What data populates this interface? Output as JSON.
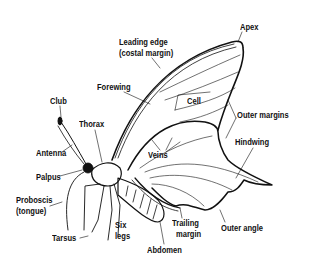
{
  "diagram": {
    "colors": {
      "ink": "#111111",
      "background": "#ffffff"
    },
    "labels": [
      {
        "id": "apex",
        "text": "Apex",
        "x": 240,
        "y": 23
      },
      {
        "id": "leading-edge",
        "text": "Leading edge",
        "x": 119,
        "y": 38
      },
      {
        "id": "costal-margin",
        "text": "(costal margin)",
        "x": 119,
        "y": 49
      },
      {
        "id": "forewing",
        "text": "Forewing",
        "x": 97,
        "y": 83
      },
      {
        "id": "club",
        "text": "Club",
        "x": 50,
        "y": 97
      },
      {
        "id": "cell",
        "text": "Cell",
        "x": 187,
        "y": 97
      },
      {
        "id": "outer-margins",
        "text": "Outer margins",
        "x": 237,
        "y": 111
      },
      {
        "id": "thorax",
        "text": "Thorax",
        "x": 79,
        "y": 120
      },
      {
        "id": "hindwing",
        "text": "Hindwing",
        "x": 235,
        "y": 138
      },
      {
        "id": "veins",
        "text": "Veins",
        "x": 148,
        "y": 151
      },
      {
        "id": "antenna",
        "text": "Antenna",
        "x": 36,
        "y": 149
      },
      {
        "id": "palpus",
        "text": "Palpus",
        "x": 36,
        "y": 173
      },
      {
        "id": "proboscis",
        "text": "Proboscis",
        "x": 16,
        "y": 196
      },
      {
        "id": "tongue",
        "text": "(tongue)",
        "x": 16,
        "y": 207
      },
      {
        "id": "six",
        "text": "Six",
        "x": 115,
        "y": 221
      },
      {
        "id": "legs",
        "text": "legs",
        "x": 115,
        "y": 232
      },
      {
        "id": "trailing",
        "text": "Trailing",
        "x": 172,
        "y": 219
      },
      {
        "id": "trailing-margin",
        "text": "margin",
        "x": 176,
        "y": 230
      },
      {
        "id": "outer-angle",
        "text": "Outer angle",
        "x": 221,
        "y": 224
      },
      {
        "id": "tarsus",
        "text": "Tarsus",
        "x": 52,
        "y": 234
      },
      {
        "id": "abdomen",
        "text": "Abdomen",
        "x": 147,
        "y": 246
      }
    ]
  }
}
